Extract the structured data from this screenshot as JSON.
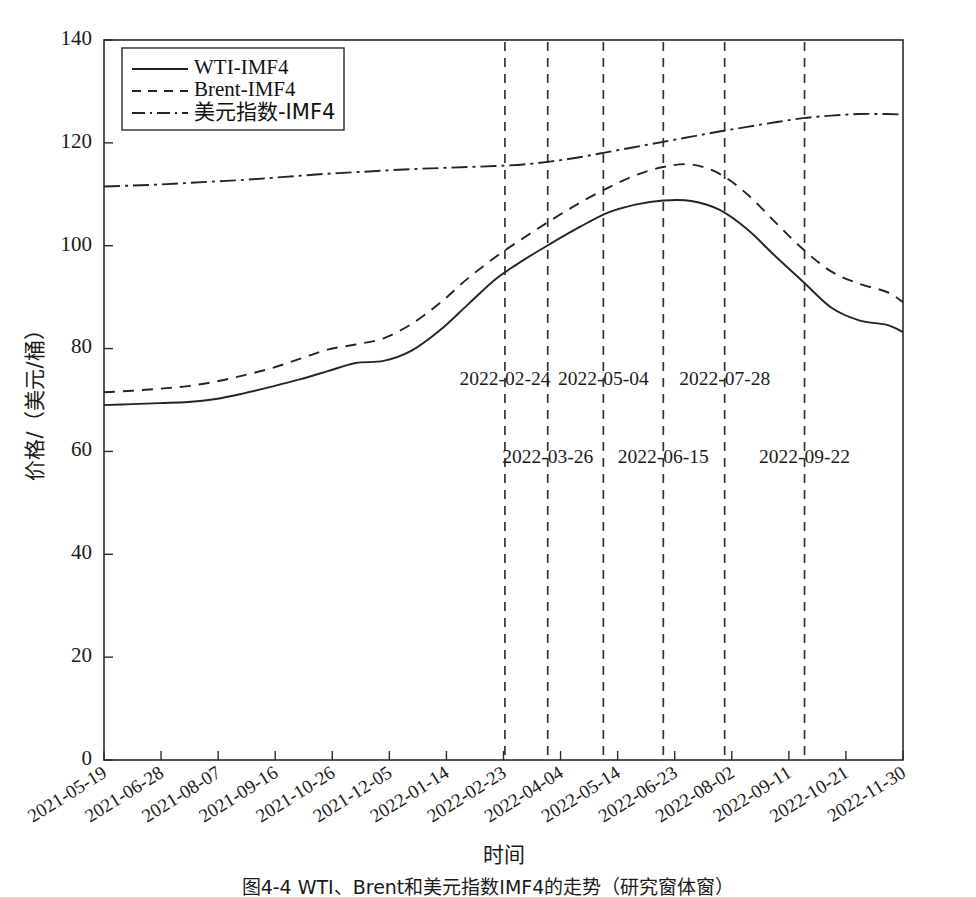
{
  "figure": {
    "caption": "图4-4  WTI、Brent和美元指数IMF4的走势（研究窗体窗）",
    "xlabel": "时间",
    "ylabel": "价格/（美元/桶）"
  },
  "legend": {
    "position": "top-left",
    "items": [
      {
        "label": "WTI-IMF4",
        "style": "solid"
      },
      {
        "label": "Brent-IMF4",
        "style": "dashed"
      },
      {
        "label": "美元指数-IMF4",
        "style": "dashdot"
      }
    ]
  },
  "annotations": [
    {
      "label": "2022-02-24",
      "x": "2022-02-24",
      "row": "upper"
    },
    {
      "label": "2022-03-26",
      "x": "2022-03-26",
      "row": "lower"
    },
    {
      "label": "2022-05-04",
      "x": "2022-05-04",
      "row": "upper"
    },
    {
      "label": "2022-06-15",
      "x": "2022-06-15",
      "row": "lower"
    },
    {
      "label": "2022-07-28",
      "x": "2022-07-28",
      "row": "upper"
    },
    {
      "label": "2022-09-22",
      "x": "2022-09-22",
      "row": "lower"
    }
  ],
  "chart_data": {
    "type": "line",
    "title": "",
    "xlabel": "时间",
    "ylabel": "价格/（美元/桶）",
    "ylim": [
      0,
      140
    ],
    "yticks": [
      0,
      20,
      40,
      60,
      80,
      100,
      120,
      140
    ],
    "grid": false,
    "legend_position": "upper left",
    "xlim": [
      "2021-05-19",
      "2022-11-30"
    ],
    "xticks": [
      "2021-05-19",
      "2021-06-28",
      "2021-08-07",
      "2021-09-16",
      "2021-10-26",
      "2021-12-05",
      "2022-01-14",
      "2022-02-23",
      "2022-04-04",
      "2022-05-14",
      "2022-06-23",
      "2022-08-02",
      "2022-09-11",
      "2022-10-21",
      "2022-11-30"
    ],
    "x_index_fraction": [
      0.0,
      0.035,
      0.07,
      0.105,
      0.14,
      0.175,
      0.21,
      0.245,
      0.28,
      0.315,
      0.35,
      0.385,
      0.42,
      0.455,
      0.49,
      0.525,
      0.56,
      0.595,
      0.63,
      0.665,
      0.7,
      0.735,
      0.77,
      0.805,
      0.84,
      0.875,
      0.91,
      0.945,
      0.98,
      1.0
    ],
    "series": [
      {
        "name": "WTI-IMF4",
        "style": "solid",
        "values": [
          69.0,
          69.2,
          69.4,
          69.6,
          70.2,
          71.3,
          72.6,
          74.0,
          75.6,
          77.2,
          77.6,
          79.6,
          83.5,
          88.5,
          93.5,
          97.2,
          100.5,
          103.6,
          106.4,
          108.0,
          108.8,
          108.7,
          107.0,
          103.2,
          98.0,
          93.0,
          88.0,
          85.5,
          84.6,
          83.2
        ]
      },
      {
        "name": "Brent-IMF4",
        "style": "dashed",
        "values": [
          71.5,
          71.8,
          72.2,
          72.7,
          73.6,
          74.8,
          76.2,
          78.0,
          79.8,
          80.8,
          82.0,
          84.8,
          88.8,
          93.6,
          97.8,
          101.5,
          105.0,
          108.3,
          111.2,
          113.7,
          115.3,
          115.8,
          114.0,
          110.0,
          104.6,
          99.3,
          95.0,
          92.6,
          91.0,
          89.0
        ]
      },
      {
        "name": "美元指数-IMF4",
        "style": "dashdot",
        "values": [
          111.5,
          111.7,
          111.9,
          112.2,
          112.5,
          112.8,
          113.2,
          113.6,
          114.0,
          114.3,
          114.6,
          114.9,
          115.1,
          115.3,
          115.5,
          115.8,
          116.4,
          117.2,
          118.2,
          119.2,
          120.2,
          121.2,
          122.2,
          123.1,
          124.0,
          124.8,
          125.3,
          125.6,
          125.6,
          125.5
        ]
      }
    ],
    "vertical_lines": [
      "2022-02-24",
      "2022-03-26",
      "2022-05-04",
      "2022-06-15",
      "2022-07-28",
      "2022-09-22"
    ]
  }
}
